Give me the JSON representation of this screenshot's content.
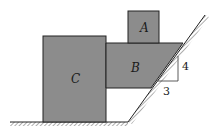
{
  "diagram": {
    "type": "physics-free-body-setup",
    "colors": {
      "block_fill": "#8c8c8c",
      "block_stroke": "#222222",
      "ground": "#222222",
      "background": "#ffffff"
    },
    "blocks": [
      {
        "id": "A",
        "label": "A",
        "shape": "square",
        "rests_on": "B"
      },
      {
        "id": "B",
        "label": "B",
        "shape": "trapezoid",
        "contacts": [
          "C",
          "incline"
        ]
      },
      {
        "id": "C",
        "label": "C",
        "shape": "rectangle",
        "rests_on": "ground"
      }
    ],
    "incline": {
      "slope_triangle": {
        "rise_label": "4",
        "run_label": "3"
      }
    },
    "ground": {
      "hatched": true
    }
  }
}
